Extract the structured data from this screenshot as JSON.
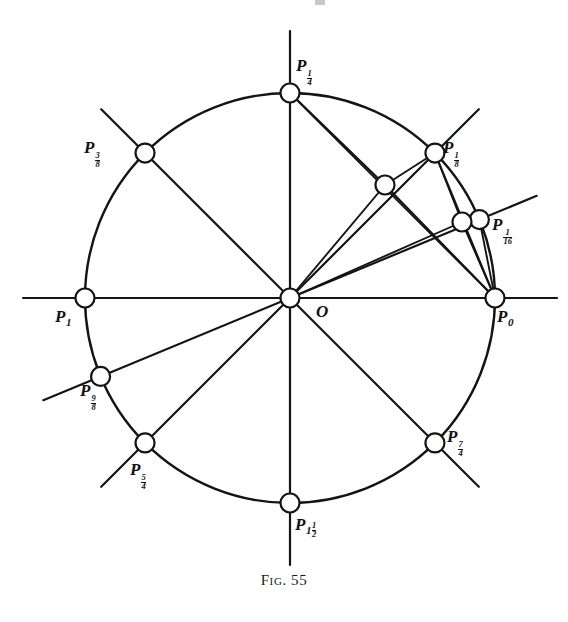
{
  "figure": {
    "caption_prefix": "Fig.",
    "caption_number": "55",
    "caption_full": "Fig. 55",
    "origin_label": "O"
  },
  "geometry": {
    "center_x": 290,
    "center_y": 298,
    "radius": 205,
    "circle_stroke": "#141414",
    "line_stroke": "#141414",
    "node_fill": "#ffffff",
    "node_radius": 9.5,
    "axis_overshoot": 62
  },
  "points": [
    {
      "id": "P0",
      "base": "P",
      "sub_type": "integer",
      "sub": "0",
      "angle_deg": 0,
      "on_circle": true,
      "label_x": 497,
      "label_y": 308
    },
    {
      "id": "P1_16",
      "base": "P",
      "sub_type": "fraction",
      "sub_num": "1",
      "sub_den": "16",
      "angle_deg": 22.5,
      "on_circle": true,
      "label_x": 492,
      "label_y": 216
    },
    {
      "id": "P1_8",
      "base": "P",
      "sub_type": "fraction",
      "sub_num": "1",
      "sub_den": "8",
      "angle_deg": 45,
      "on_circle": true,
      "label_x": 443,
      "label_y": 139
    },
    {
      "id": "P1_4",
      "base": "P",
      "sub_type": "fraction",
      "sub_num": "1",
      "sub_den": "4",
      "angle_deg": 90,
      "on_circle": true,
      "label_x": 296,
      "label_y": 57
    },
    {
      "id": "P3_8",
      "base": "P",
      "sub_type": "fraction",
      "sub_num": "3",
      "sub_den": "8",
      "angle_deg": 135,
      "on_circle": true,
      "label_x": 84,
      "label_y": 139
    },
    {
      "id": "P1",
      "base": "P",
      "sub_type": "integer",
      "sub": "1",
      "angle_deg": 180,
      "on_circle": true,
      "label_x": 55,
      "label_y": 308
    },
    {
      "id": "P9_8",
      "base": "P",
      "sub_type": "fraction",
      "sub_num": "9",
      "sub_den": "8",
      "angle_deg": 202.5,
      "on_circle": true,
      "label_x": 80,
      "label_y": 382
    },
    {
      "id": "P5_4",
      "base": "P",
      "sub_type": "fraction",
      "sub_num": "5",
      "sub_den": "4",
      "angle_deg": 225,
      "on_circle": true,
      "label_x": 130,
      "label_y": 461
    },
    {
      "id": "P3_2",
      "base": "P",
      "sub_type": "mixed",
      "sub_whole": "1",
      "sub_num": "1",
      "sub_den": "2",
      "angle_deg": 270,
      "on_circle": true,
      "label_x": 295,
      "label_y": 516
    },
    {
      "id": "P7_4",
      "base": "P",
      "sub_type": "fraction",
      "sub_num": "7",
      "sub_den": "4",
      "angle_deg": 315,
      "on_circle": true,
      "label_x": 447,
      "label_y": 428
    }
  ],
  "interior_nodes": [
    {
      "id": "M1",
      "x": 385,
      "y": 185,
      "desc": "midpoint-chord-P0-P1_4"
    },
    {
      "id": "M2",
      "x": 462,
      "y": 222,
      "desc": "midpoint-chord-P0-P1_8"
    }
  ],
  "diameters": [
    {
      "angle_deg": 0,
      "label": "P0-P1"
    },
    {
      "angle_deg": 45,
      "label": "P1_8-P9_8"
    },
    {
      "angle_deg": 90,
      "label": "P1_4-P3_2"
    },
    {
      "angle_deg": 135,
      "label": "P3_8-P7_4"
    },
    {
      "angle_deg": 22.5,
      "label": "P1_16-P9_8-line"
    },
    {
      "angle_deg": 225,
      "label": "P5_4-P1_4-line"
    }
  ],
  "chords": [
    {
      "from": "P0",
      "to": "P1_4",
      "desc": "chord-P0-to-P1_4"
    },
    {
      "from": "P0",
      "to": "P1_8",
      "desc": "chord-P0-to-P1_8"
    },
    {
      "from": "P0",
      "to": "P1_16",
      "desc": "chord-P0-to-P1_16"
    },
    {
      "from": "P1_8",
      "to": "M2",
      "desc": "chord-P1_8-to-midpoint"
    },
    {
      "from": "P1_4",
      "to": "M1",
      "desc": "chord-P1_4-to-midpoint"
    }
  ]
}
